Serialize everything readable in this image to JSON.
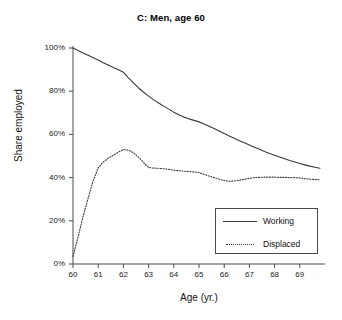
{
  "chart_data": {
    "type": "line",
    "title": "C: Men, age 60",
    "xlabel": "Age (yr.)",
    "ylabel": "Share employed",
    "xlim": [
      60,
      70
    ],
    "ylim": [
      0,
      1
    ],
    "grid": false,
    "legend_position": "lower-right",
    "x_tick_labels": [
      "60",
      "61",
      "62",
      "63",
      "64",
      "65",
      "66",
      "67",
      "68",
      "69"
    ],
    "x_tick_values": [
      60,
      61,
      62,
      63,
      64,
      65,
      66,
      67,
      68,
      69
    ],
    "y_tick_labels": [
      "0%",
      "20%",
      "40%",
      "60%",
      "80%",
      "100%"
    ],
    "y_tick_values": [
      0,
      0.2,
      0.4,
      0.6,
      0.8,
      1.0
    ],
    "x": [
      60.0,
      60.2,
      60.4,
      60.6,
      60.8,
      61.0,
      61.2,
      61.4,
      61.6,
      61.8,
      62.0,
      62.2,
      62.4,
      62.6,
      62.8,
      63.0,
      63.2,
      63.4,
      63.6,
      63.8,
      64.0,
      64.2,
      64.4,
      64.6,
      64.8,
      65.0,
      65.2,
      65.4,
      65.6,
      65.8,
      66.0,
      66.2,
      66.4,
      66.6,
      66.8,
      67.0,
      67.2,
      67.4,
      67.6,
      67.8,
      68.0,
      68.2,
      68.4,
      68.6,
      68.8,
      69.0,
      69.2,
      69.4,
      69.6,
      69.8
    ],
    "series": [
      {
        "name": "Working",
        "style": "solid",
        "color": "#3a3a3a",
        "values": [
          1.0,
          0.988,
          0.977,
          0.966,
          0.955,
          0.944,
          0.932,
          0.921,
          0.91,
          0.899,
          0.888,
          0.862,
          0.838,
          0.815,
          0.795,
          0.777,
          0.76,
          0.745,
          0.731,
          0.717,
          0.703,
          0.691,
          0.68,
          0.672,
          0.665,
          0.658,
          0.648,
          0.638,
          0.627,
          0.616,
          0.604,
          0.593,
          0.582,
          0.571,
          0.561,
          0.551,
          0.541,
          0.531,
          0.521,
          0.512,
          0.503,
          0.495,
          0.487,
          0.479,
          0.472,
          0.465,
          0.459,
          0.453,
          0.448,
          0.443
        ]
      },
      {
        "name": "Displaced",
        "style": "dotted",
        "color": "#3a3a3a",
        "values": [
          0.035,
          0.125,
          0.22,
          0.305,
          0.385,
          0.445,
          0.472,
          0.49,
          0.503,
          0.518,
          0.53,
          0.527,
          0.515,
          0.494,
          0.47,
          0.447,
          0.444,
          0.443,
          0.441,
          0.438,
          0.434,
          0.432,
          0.43,
          0.428,
          0.426,
          0.423,
          0.415,
          0.407,
          0.4,
          0.393,
          0.386,
          0.383,
          0.384,
          0.388,
          0.392,
          0.397,
          0.4,
          0.401,
          0.402,
          0.402,
          0.402,
          0.401,
          0.401,
          0.4,
          0.4,
          0.398,
          0.395,
          0.393,
          0.391,
          0.39
        ]
      }
    ]
  }
}
